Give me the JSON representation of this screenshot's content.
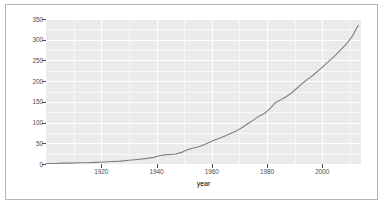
{
  "chart_data": {
    "type": "line",
    "title": "",
    "subtitle": "",
    "xlabel": "year",
    "ylabel": "",
    "xlim": [
      1900,
      2014
    ],
    "ylim": [
      0,
      350
    ],
    "grid": true,
    "legend": null,
    "legend_position": "none",
    "x_ticks": [
      1920,
      1940,
      1960,
      1980,
      2000
    ],
    "x_tick_labels": [
      "1920",
      "1940",
      "1960",
      "1980",
      "2000"
    ],
    "y_ticks": [
      0,
      50,
      100,
      150,
      200,
      250,
      300,
      350
    ],
    "y_tick_labels": [
      "0",
      "50",
      "100",
      "150",
      "200",
      "250",
      "300",
      "350"
    ],
    "series": [
      {
        "name": "value",
        "color": "#7f7f7f",
        "x": [
          1900,
          1903,
          1906,
          1909,
          1912,
          1915,
          1918,
          1921,
          1924,
          1927,
          1930,
          1933,
          1936,
          1939,
          1941,
          1943,
          1945,
          1947,
          1949,
          1951,
          1953,
          1955,
          1957,
          1959,
          1961,
          1963,
          1965,
          1967,
          1969,
          1971,
          1973,
          1975,
          1977,
          1979,
          1981,
          1983,
          1985,
          1987,
          1989,
          1991,
          1993,
          1995,
          1997,
          1999,
          2001,
          2003,
          2005,
          2007,
          2009,
          2011,
          2013
        ],
        "values": [
          1,
          1,
          2,
          2,
          3,
          3,
          4,
          5,
          6,
          7,
          9,
          11,
          13,
          16,
          20,
          22,
          23,
          24,
          28,
          34,
          38,
          41,
          46,
          52,
          58,
          63,
          68,
          74,
          80,
          88,
          97,
          106,
          115,
          122,
          133,
          148,
          155,
          163,
          172,
          184,
          196,
          206,
          216,
          228,
          240,
          252,
          264,
          278,
          292,
          310,
          335
        ]
      }
    ]
  },
  "axes": {
    "x_title": "year"
  }
}
